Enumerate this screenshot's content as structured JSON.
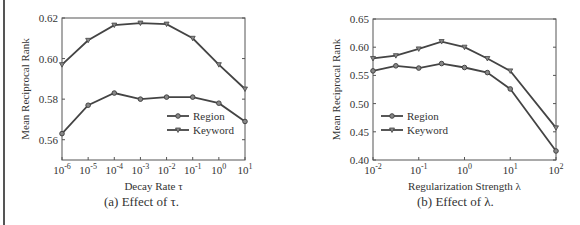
{
  "chart_data": [
    {
      "type": "line",
      "caption": "(a) Effect of τ.",
      "xlabel": "Decay Rate τ",
      "ylabel": "Mean Reciprocal Rank",
      "x_ticks": [
        "10^-6",
        "10^-5",
        "10^-4",
        "10^-3",
        "10^-2",
        "10^-1",
        "10^0",
        "10^1"
      ],
      "x": [
        1e-06,
        1e-05,
        0.0001,
        0.001,
        0.01,
        0.1,
        1,
        10
      ],
      "y_ticks": [
        0.56,
        0.58,
        0.6,
        0.62
      ],
      "ylim": [
        0.55,
        0.62
      ],
      "legend_position": "lower right",
      "series": [
        {
          "name": "Region",
          "marker": "diamond",
          "values": [
            0.563,
            0.577,
            0.583,
            0.58,
            0.581,
            0.581,
            0.578,
            0.569
          ]
        },
        {
          "name": "Keyword",
          "marker": "triangle-down",
          "values": [
            0.597,
            0.609,
            0.6165,
            0.6175,
            0.617,
            0.61,
            0.597,
            0.585
          ]
        }
      ]
    },
    {
      "type": "line",
      "caption": "(b) Effect of λ.",
      "xlabel": "Regularization Strength λ",
      "ylabel": "Mean Reciprocal Rank",
      "x_ticks": [
        "10^-2",
        "10^-1",
        "10^0",
        "10^1",
        "10^2"
      ],
      "x": [
        0.01,
        0.0316,
        0.1,
        0.316,
        1,
        3.16,
        10,
        100
      ],
      "y_ticks": [
        0.4,
        0.45,
        0.5,
        0.55,
        0.6,
        0.65
      ],
      "ylim": [
        0.4,
        0.65
      ],
      "legend_position": "lower left",
      "series": [
        {
          "name": "Region",
          "marker": "diamond",
          "values": [
            0.558,
            0.567,
            0.563,
            0.571,
            0.564,
            0.555,
            0.526,
            0.416
          ]
        },
        {
          "name": "Keyword",
          "marker": "triangle-down",
          "values": [
            0.58,
            0.585,
            0.597,
            0.61,
            0.6,
            0.58,
            0.558,
            0.457
          ]
        }
      ]
    }
  ],
  "captions": {
    "a": "(a) Effect of τ.",
    "b": "(b) Effect of λ."
  }
}
